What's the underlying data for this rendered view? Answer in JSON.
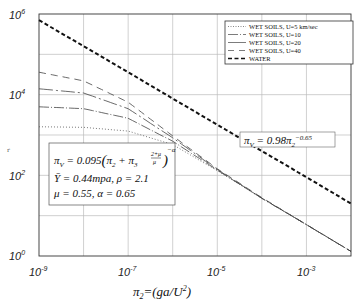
{
  "chart_data": {
    "type": "line",
    "title": "",
    "xlabel": "π2=(ga/U2)",
    "ylabel": "",
    "xscale": "log",
    "yscale": "log",
    "xlim": [
      1e-09,
      0.01
    ],
    "ylim": [
      1,
      1000000.0
    ],
    "grid": true,
    "legend_position": "upper right",
    "x_tick_labels": [
      "10-9",
      "10-7",
      "10-5",
      "10-3"
    ],
    "y_tick_labels": [
      "100",
      "102",
      "104",
      "106"
    ],
    "x": [
      1e-09,
      1e-08,
      1e-07,
      1e-06,
      1e-05,
      0.0001,
      0.001,
      0.01
    ],
    "series": [
      {
        "name": "WET SOILS, U=5 km/sec",
        "style": "dotted",
        "values": [
          1600,
          1550,
          1250,
          580,
          130,
          27,
          6,
          1.3
        ]
      },
      {
        "name": "WET SOILS, U=10",
        "style": "dash-dot",
        "values": [
          5000,
          4500,
          2600,
          700,
          135,
          27,
          6,
          1.3
        ]
      },
      {
        "name": "WET SOILS, U=20",
        "style": "long-dash-dot",
        "values": [
          14000,
          11000,
          4500,
          850,
          140,
          27,
          6,
          1.3
        ]
      },
      {
        "name": "WET SOILS, U=40",
        "style": "long-dash",
        "values": [
          36000,
          22000,
          6500,
          950,
          145,
          28,
          6,
          1.3
        ]
      },
      {
        "name": "WATER",
        "style": "bold-dash",
        "values": [
          700000,
          160000,
          36000,
          8000,
          1800,
          400,
          90,
          20
        ]
      }
    ],
    "annotations": [
      {
        "text": "πV = 0.98 π2^-0.65",
        "position": "right-middle, near water line"
      },
      {
        "text": "πV = 0.095 (π2 + π3^((2+μ)/μ))^-α",
        "position": "lower-left box"
      },
      {
        "text": "Y = 0.44mpa, ρ = 2.1",
        "position": "lower-left box"
      },
      {
        "text": "μ = 0.55, α = 0.65",
        "position": "lower-left box"
      }
    ]
  },
  "axes": {
    "x_ticks": [
      {
        "base": "10",
        "exp": "-9"
      },
      {
        "base": "10",
        "exp": "-7"
      },
      {
        "base": "10",
        "exp": "-5"
      },
      {
        "base": "10",
        "exp": "-3"
      }
    ],
    "y_ticks": [
      {
        "base": "10",
        "exp": "0"
      },
      {
        "base": "10",
        "exp": "2"
      },
      {
        "base": "10",
        "exp": "4"
      },
      {
        "base": "10",
        "exp": "6"
      }
    ],
    "xlabel_main": "π",
    "xlabel_sub": "2",
    "xlabel_rest": "=(ga/U",
    "xlabel_sup": "2",
    "xlabel_close": ")",
    "ylabel_mark": "r"
  },
  "legend": {
    "items": [
      {
        "label": "WET SOILS, U=5 km/sec"
      },
      {
        "label": "WET SOILS, U=10"
      },
      {
        "label": "WET SOILS, U=20"
      },
      {
        "label": "WET SOILS, U=40"
      },
      {
        "label": "WATER"
      }
    ]
  },
  "equations": {
    "water_fit": {
      "lhs": "π",
      "lhs_sub": "V",
      "rhs": " = 0.98π",
      "rhs_sub": "2",
      "exp": "−0.65"
    },
    "model": {
      "line1_lhs": "π",
      "line1_lhs_sub": "V",
      "line1_rhs": " = 0.095",
      "inner_a": "π",
      "inner_a_sub": "2",
      "inner_plus": " + ",
      "inner_b": "π",
      "inner_b_sub": "3",
      "inner_exp_num": "2+μ",
      "inner_exp_den": "μ",
      "outer_exp": "−α",
      "line2": "Ȳ = 0.44mpa,  ρ = 2.1",
      "line3": "μ = 0.55,  α = 0.65"
    }
  }
}
